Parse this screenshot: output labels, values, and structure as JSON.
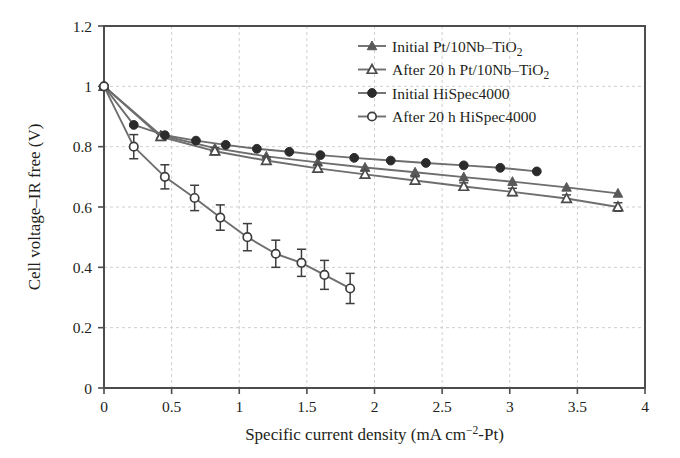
{
  "figure": {
    "width": 680,
    "height": 458,
    "background": "#ffffff"
  },
  "chart_data": {
    "type": "line",
    "title": "",
    "xlabel": "Specific current density (mA cm−2-Pt)",
    "xlabel_parts": {
      "prefix": "Specific current density (mA cm",
      "exponent": "−2",
      "suffix": "-Pt)"
    },
    "ylabel": "Cell voltage–IR free (V)",
    "xlim": [
      0,
      4
    ],
    "ylim": [
      0,
      1.2
    ],
    "xticks": [
      0,
      0.5,
      1,
      1.5,
      2,
      2.5,
      3,
      3.5,
      4
    ],
    "xtick_labels": [
      "0",
      "0.5",
      "1",
      "1.5",
      "2",
      "2.5",
      "3",
      "3.5",
      "4"
    ],
    "yticks": [
      0,
      0.2,
      0.4,
      0.6,
      0.8,
      1,
      1.2
    ],
    "ytick_labels": [
      "0",
      "0.2",
      "0.4",
      "0.6",
      "0.8",
      "1",
      "1.2"
    ],
    "grid": true,
    "grid_style": "dashed",
    "grid_color": "#cfcfcf",
    "legend_position": "top-right",
    "axis_color": "#4d4d4d",
    "series": [
      {
        "name": "Initial Pt/10Nb–TiO2",
        "label_parts": {
          "prefix": "Initial Pt/10Nb–TiO",
          "sub": "2"
        },
        "marker": "filled-triangle",
        "color": "#595959",
        "line_color": "#6e6e6e",
        "x": [
          0.0,
          0.42,
          0.82,
          1.2,
          1.58,
          1.93,
          2.3,
          2.66,
          3.02,
          3.42,
          3.8
        ],
        "y": [
          1.0,
          0.838,
          0.795,
          0.768,
          0.748,
          0.731,
          0.715,
          0.699,
          0.684,
          0.665,
          0.645
        ],
        "yerr": [
          0,
          0,
          0,
          0,
          0,
          0,
          0,
          0,
          0,
          0,
          0
        ]
      },
      {
        "name": "After 20 h Pt/10Nb–TiO2",
        "label_parts": {
          "prefix": "After 20 h Pt/10Nb–TiO",
          "sub": "2"
        },
        "marker": "open-triangle",
        "color": "#4a4a4a",
        "line_color": "#6e6e6e",
        "x": [
          0.0,
          0.42,
          0.82,
          1.2,
          1.58,
          1.93,
          2.3,
          2.66,
          3.02,
          3.42,
          3.8
        ],
        "y": [
          1.0,
          0.833,
          0.785,
          0.754,
          0.728,
          0.708,
          0.688,
          0.668,
          0.65,
          0.628,
          0.6
        ],
        "yerr": [
          0,
          0.012,
          0.012,
          0.012,
          0.012,
          0.012,
          0.012,
          0.012,
          0.012,
          0.012,
          0.014
        ]
      },
      {
        "name": "Initial HiSpec4000",
        "label_parts": {
          "prefix": "Initial HiSpec4000",
          "sub": ""
        },
        "marker": "filled-circle",
        "color": "#2b2b2b",
        "line_color": "#6e6e6e",
        "x": [
          0.0,
          0.22,
          0.45,
          0.68,
          0.9,
          1.13,
          1.37,
          1.6,
          1.85,
          2.12,
          2.38,
          2.66,
          2.93,
          3.2
        ],
        "y": [
          1.0,
          0.872,
          0.838,
          0.82,
          0.806,
          0.793,
          0.783,
          0.772,
          0.763,
          0.754,
          0.746,
          0.738,
          0.73,
          0.718
        ],
        "yerr": [
          0,
          0,
          0,
          0,
          0,
          0,
          0,
          0,
          0,
          0,
          0,
          0,
          0,
          0
        ]
      },
      {
        "name": "After 20 h HiSpec4000",
        "label_parts": {
          "prefix": "After 20 h HiSpec4000",
          "sub": ""
        },
        "marker": "open-circle",
        "color": "#3d3d3d",
        "line_color": "#6e6e6e",
        "x": [
          0.0,
          0.22,
          0.45,
          0.67,
          0.86,
          1.06,
          1.27,
          1.46,
          1.63,
          1.82
        ],
        "y": [
          1.0,
          0.8,
          0.7,
          0.63,
          0.565,
          0.5,
          0.445,
          0.415,
          0.375,
          0.33
        ],
        "yerr": [
          0,
          0.04,
          0.04,
          0.042,
          0.042,
          0.045,
          0.045,
          0.045,
          0.048,
          0.05
        ]
      }
    ]
  }
}
